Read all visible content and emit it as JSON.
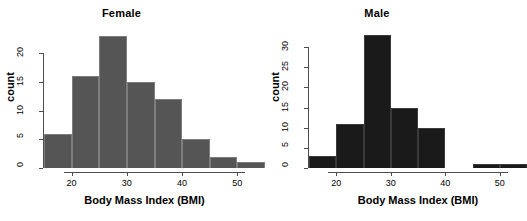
{
  "figure": {
    "background": "#ffffff",
    "panel_count": 2
  },
  "chart_data": [
    {
      "type": "bar",
      "title": "Female",
      "xlabel": "Body Mass Index (BMI)",
      "ylabel": "count",
      "bin_width": 5,
      "bin_starts": [
        15,
        20,
        25,
        30,
        35,
        40,
        45,
        50
      ],
      "categories": [
        "15-20",
        "20-25",
        "25-30",
        "30-35",
        "35-40",
        "40-45",
        "45-50",
        "50-55"
      ],
      "values": [
        6,
        16,
        23,
        15,
        12,
        5,
        2,
        1
      ],
      "xticks": [
        20,
        30,
        40,
        50
      ],
      "xticklabels": [
        "20",
        "30",
        "40",
        "50"
      ],
      "yticks": [
        0,
        5,
        10,
        15,
        20
      ],
      "yticklabels": [
        "0",
        "5",
        "10",
        "15",
        "20"
      ],
      "xlim": [
        15,
        55
      ],
      "ylim": [
        0,
        23.5
      ],
      "grid": false,
      "bar_color": "#555555",
      "bar_border_color": "#7d7d7d"
    },
    {
      "type": "bar",
      "title": "Male",
      "xlabel": "Body Mass Index (BMI)",
      "ylabel": "count",
      "bin_width": 5,
      "bin_starts": [
        15,
        20,
        25,
        30,
        35,
        40,
        45,
        50
      ],
      "categories": [
        "15-20",
        "20-25",
        "25-30",
        "30-35",
        "35-40",
        "40-45",
        "45-50",
        "50-55"
      ],
      "values": [
        3,
        11,
        33,
        15,
        10,
        0,
        1,
        1
      ],
      "xticks": [
        20,
        30,
        40,
        50
      ],
      "xticklabels": [
        "20",
        "30",
        "40",
        "50"
      ],
      "yticks": [
        0,
        5,
        10,
        15,
        20,
        25,
        30
      ],
      "yticklabels": [
        "0",
        "5",
        "10",
        "15",
        "20",
        "25",
        "30"
      ],
      "xlim": [
        15,
        55
      ],
      "ylim": [
        0,
        33.5
      ],
      "grid": false,
      "bar_color": "#1a1a1a",
      "bar_border_color": "#3a3a3a"
    }
  ]
}
